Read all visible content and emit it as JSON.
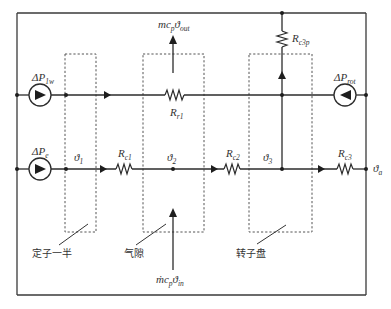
{
  "diagram": {
    "type": "thermal-network",
    "sources": {
      "p1w": {
        "label": "ΔP",
        "sub": "1w"
      },
      "pe": {
        "label": "ΔP",
        "sub": "e"
      },
      "prot": {
        "label": "ΔP",
        "sub": "rot"
      }
    },
    "resistors": {
      "rr1": {
        "label": "R",
        "sub": "r1"
      },
      "rc1": {
        "label": "R",
        "sub": "c1"
      },
      "rc2": {
        "label": "R",
        "sub": "c2"
      },
      "rc3": {
        "label": "R",
        "sub": "c3"
      },
      "rc3p": {
        "label": "R",
        "sub": "c3p"
      }
    },
    "nodes": {
      "t1": {
        "label": "ϑ",
        "sub": "1"
      },
      "t2": {
        "label": "ϑ",
        "sub": "2"
      },
      "t3": {
        "label": "ϑ",
        "sub": "3"
      },
      "ta": {
        "label": "ϑ",
        "sub": "a"
      }
    },
    "flows": {
      "out": {
        "label": "mc",
        "sub1": "p",
        "theta": "ϑ",
        "sub2": "out"
      },
      "in": {
        "label": "ṁc",
        "sub1": "p",
        "theta": "ϑ",
        "sub2": "in"
      }
    },
    "regions": {
      "stator_half": "定子一半",
      "air_gap": "气隙",
      "rotor_disk": "转子盘"
    }
  }
}
